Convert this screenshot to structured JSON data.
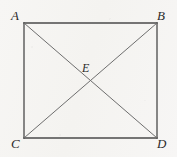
{
  "figure": {
    "kind": "geometry-diagram",
    "width": 177,
    "height": 157,
    "background_color": "#f6f5f3",
    "edge_color": "#4a4a4a",
    "diagonal_color": "#6e6e6e",
    "label_color": "#2b2b2b",
    "vertices": [
      {
        "id": "A",
        "label": "A",
        "x": 24,
        "y": 23,
        "label_x": 11,
        "label_y": 9
      },
      {
        "id": "B",
        "label": "B",
        "x": 157,
        "y": 23,
        "label_x": 157,
        "label_y": 9
      },
      {
        "id": "C",
        "label": "C",
        "x": 24,
        "y": 138,
        "label_x": 11,
        "label_y": 137
      },
      {
        "id": "D",
        "label": "D",
        "x": 157,
        "y": 138,
        "label_x": 157,
        "label_y": 137
      },
      {
        "id": "E",
        "label": "E",
        "x": 90.5,
        "y": 80.5,
        "label_x": 82,
        "label_y": 62
      }
    ],
    "edges": [
      {
        "name": "side-AB",
        "from": "A",
        "to": "B",
        "x1": 24,
        "y1": 23,
        "x2": 157,
        "y2": 23,
        "width": 1.3
      },
      {
        "name": "side-BD",
        "from": "B",
        "to": "D",
        "x1": 157,
        "y1": 23,
        "x2": 157,
        "y2": 138,
        "width": 1.3
      },
      {
        "name": "side-DC",
        "from": "D",
        "to": "C",
        "x1": 157,
        "y1": 138,
        "x2": 24,
        "y2": 138,
        "width": 1.3
      },
      {
        "name": "side-CA",
        "from": "C",
        "to": "A",
        "x1": 24,
        "y1": 138,
        "x2": 24,
        "y2": 23,
        "width": 1.3
      }
    ],
    "diagonals": [
      {
        "name": "diagonal-AD",
        "from": "A",
        "to": "D",
        "x1": 24,
        "y1": 23,
        "x2": 157,
        "y2": 138,
        "width": 1.0
      },
      {
        "name": "diagonal-BC",
        "from": "B",
        "to": "C",
        "x1": 157,
        "y1": 23,
        "x2": 24,
        "y2": 138,
        "width": 1.0
      }
    ]
  }
}
